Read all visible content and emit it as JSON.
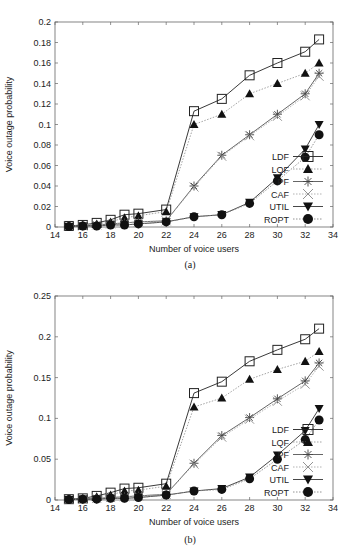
{
  "chart_data": [
    {
      "type": "line",
      "panel": "(a)",
      "caption": "(a)",
      "xlabel": "Number of voice users",
      "ylabel": "Voice outage probability",
      "xlim": [
        14,
        34
      ],
      "ylim": [
        0,
        0.2
      ],
      "xticks": [
        14,
        16,
        18,
        20,
        22,
        24,
        26,
        28,
        30,
        32,
        34
      ],
      "yticks": [
        0,
        0.02,
        0.04,
        0.06,
        0.08,
        0.1,
        0.12,
        0.14,
        0.16,
        0.18,
        0.2
      ],
      "ytick_labels": [
        "0",
        "0.02",
        "0.04",
        "0.06",
        "0.08",
        "0.1",
        "0.12",
        "0.14",
        "0.16",
        "0.18",
        "0.2"
      ],
      "grid": false,
      "legend_position": "lower right",
      "x": [
        15,
        16,
        17,
        18,
        19,
        20,
        22,
        24,
        26,
        28,
        30,
        32,
        33
      ],
      "series": [
        {
          "name": "LDF",
          "marker": "square-open",
          "line": "solid",
          "values": [
            0.001,
            0.002,
            0.004,
            0.007,
            0.012,
            0.013,
            0.017,
            0.113,
            0.125,
            0.148,
            0.16,
            0.171,
            0.183
          ]
        },
        {
          "name": "LQF",
          "marker": "triangle-up-filled",
          "line": "dotted",
          "values": [
            0.001,
            0.002,
            0.003,
            0.005,
            0.009,
            0.011,
            0.015,
            0.1,
            0.11,
            0.13,
            0.14,
            0.15,
            0.16
          ]
        },
        {
          "name": "PF",
          "marker": "asterisk",
          "line": "solid",
          "values": [
            0.001,
            0.001,
            0.002,
            0.003,
            0.004,
            0.005,
            0.006,
            0.04,
            0.07,
            0.09,
            0.11,
            0.13,
            0.15
          ]
        },
        {
          "name": "CAF",
          "marker": "x",
          "line": "dotted",
          "values": [
            0.001,
            0.001,
            0.002,
            0.003,
            0.004,
            0.005,
            0.006,
            0.039,
            0.069,
            0.089,
            0.108,
            0.128,
            0.147
          ]
        },
        {
          "name": "UTIL",
          "marker": "triangle-down-filled",
          "line": "solid",
          "values": [
            0.0005,
            0.001,
            0.001,
            0.002,
            0.002,
            0.003,
            0.005,
            0.01,
            0.012,
            0.024,
            0.048,
            0.076,
            0.1
          ]
        },
        {
          "name": "ROPT",
          "marker": "circle-filled",
          "line": "dotted",
          "values": [
            0.0005,
            0.001,
            0.001,
            0.002,
            0.002,
            0.003,
            0.005,
            0.01,
            0.012,
            0.023,
            0.045,
            0.068,
            0.09
          ]
        }
      ]
    },
    {
      "type": "line",
      "panel": "(b)",
      "caption": "(b)",
      "xlabel": "Number of voice users",
      "ylabel": "Voice outage probability",
      "xlim": [
        14,
        34
      ],
      "ylim": [
        0,
        0.25
      ],
      "xticks": [
        14,
        16,
        18,
        20,
        22,
        24,
        26,
        28,
        30,
        32,
        34
      ],
      "yticks": [
        0,
        0.05,
        0.1,
        0.15,
        0.2,
        0.25
      ],
      "ytick_labels": [
        "0",
        "0.05",
        "0.1",
        "0.15",
        "0.2",
        "0.25"
      ],
      "grid": false,
      "legend_position": "lower right",
      "x": [
        15,
        16,
        17,
        18,
        19,
        20,
        22,
        24,
        26,
        28,
        30,
        32,
        33
      ],
      "series": [
        {
          "name": "LDF",
          "marker": "square-open",
          "line": "solid",
          "values": [
            0.001,
            0.002,
            0.005,
            0.009,
            0.014,
            0.015,
            0.02,
            0.131,
            0.145,
            0.17,
            0.184,
            0.197,
            0.21
          ]
        },
        {
          "name": "LQF",
          "marker": "triangle-up-filled",
          "line": "dotted",
          "values": [
            0.001,
            0.002,
            0.004,
            0.006,
            0.011,
            0.012,
            0.017,
            0.114,
            0.125,
            0.148,
            0.16,
            0.17,
            0.182
          ]
        },
        {
          "name": "PF",
          "marker": "asterisk",
          "line": "solid",
          "values": [
            0.001,
            0.001,
            0.002,
            0.003,
            0.004,
            0.005,
            0.007,
            0.045,
            0.079,
            0.101,
            0.124,
            0.146,
            0.168
          ]
        },
        {
          "name": "CAF",
          "marker": "x",
          "line": "dotted",
          "values": [
            0.001,
            0.001,
            0.002,
            0.003,
            0.004,
            0.005,
            0.007,
            0.044,
            0.077,
            0.099,
            0.121,
            0.142,
            0.164
          ]
        },
        {
          "name": "UTIL",
          "marker": "triangle-down-filled",
          "line": "solid",
          "values": [
            0.0005,
            0.001,
            0.001,
            0.002,
            0.002,
            0.003,
            0.006,
            0.011,
            0.014,
            0.028,
            0.055,
            0.085,
            0.112
          ]
        },
        {
          "name": "ROPT",
          "marker": "circle-filled",
          "line": "dotted",
          "values": [
            0.0005,
            0.001,
            0.001,
            0.002,
            0.002,
            0.003,
            0.006,
            0.011,
            0.013,
            0.026,
            0.05,
            0.074,
            0.098
          ]
        }
      ]
    }
  ]
}
